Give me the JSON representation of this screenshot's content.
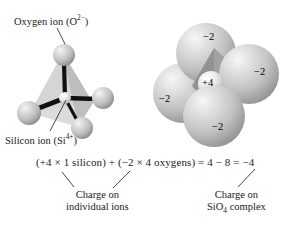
{
  "figure": {
    "background_color": "#ffffff",
    "text_color": "#1a1a1a"
  },
  "left_model": {
    "type": "ball-and-stick",
    "oxygen_label_prefix": "Oxygen ion (O",
    "oxygen_label_sup": "2−",
    "oxygen_label_suffix": ")",
    "silicon_label_prefix": "Silicon ion (Si",
    "silicon_label_sup": "4+",
    "silicon_label_suffix": ")",
    "sphere_color": "#c9c9c9",
    "bond_color": "#0d0d0d",
    "tetrahedron_color": "#c0c0c0"
  },
  "right_model": {
    "type": "space-filling",
    "charges": {
      "top": "−2",
      "right": "−2",
      "left": "−2",
      "bottom": "−2",
      "center": "+4"
    },
    "sphere_color": "#c4c4c4",
    "tetrahedron_color": "#9a9a9a"
  },
  "equation": {
    "text": "(+4 × 1 silicon) + (−2  × 4 oxygens) = 4 − 8 = −4"
  },
  "captions": {
    "left_line1": "Charge on",
    "left_line2": "individual ions",
    "right_line1": "Charge on",
    "right_line2_prefix": "SiO",
    "right_line2_sub": "4",
    "right_line2_suffix": " complex"
  }
}
